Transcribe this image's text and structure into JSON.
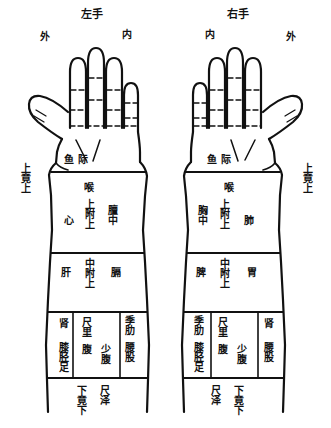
{
  "diagram": {
    "title_left": "左手",
    "title_right": "右手",
    "orientation_left_outer": "外",
    "orientation_left_inner": "内",
    "orientation_right_inner": "内",
    "orientation_right_outer": "外",
    "ink_color": "#111111",
    "background_color": "#ffffff"
  },
  "left_hand": {
    "thenar": "鱼际",
    "upper_limit": "上竟上",
    "throat": "喉",
    "zone_upper": {
      "left": "心",
      "center": "上附上",
      "right": "膻中"
    },
    "zone_middle": {
      "left": "肝",
      "center": "中附上",
      "right": "膈"
    },
    "zone_lower": {
      "left_top": "肾",
      "left_bottom": "膝胫足",
      "center_top": "尺里",
      "center_mid": "腹",
      "center_bottom": "少腹",
      "right_top": "季肋",
      "right_bottom": "腰股"
    },
    "lower_limit": "下竟下",
    "chize": "尺泽"
  },
  "right_hand": {
    "thenar": "鱼际",
    "upper_limit": "上竟上",
    "throat": "喉",
    "zone_upper": {
      "left": "胸中",
      "center": "上附上",
      "right": "肺"
    },
    "zone_middle": {
      "left": "脾",
      "center": "中附上",
      "right": "胃"
    },
    "zone_lower": {
      "left_top": "季肋",
      "left_bottom": "膝胫足",
      "center_top": "尺里",
      "center_mid": "腹",
      "center_bottom": "少腹",
      "right_top": "肾",
      "right_bottom": "腰股"
    },
    "lower_limit": "下竟下",
    "chize": "尺泽"
  }
}
